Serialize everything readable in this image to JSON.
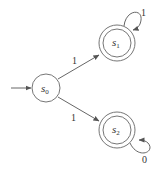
{
  "diagram": {
    "type": "finite-state-automaton",
    "colors": {
      "stroke": "#555555",
      "text": "#333333",
      "background": "#ffffff"
    },
    "states": [
      {
        "id": "s0",
        "label_base": "s",
        "label_sub": "0",
        "initial": true,
        "accepting": false
      },
      {
        "id": "s1",
        "label_base": "s",
        "label_sub": "1",
        "initial": false,
        "accepting": true
      },
      {
        "id": "s2",
        "label_base": "s",
        "label_sub": "2",
        "initial": false,
        "accepting": true
      }
    ],
    "transitions": [
      {
        "from": "s0",
        "to": "s1",
        "label": "1"
      },
      {
        "from": "s0",
        "to": "s2",
        "label": "1"
      },
      {
        "from": "s1",
        "to": "s1",
        "label": "1"
      },
      {
        "from": "s2",
        "to": "s2",
        "label": "0"
      }
    ]
  }
}
